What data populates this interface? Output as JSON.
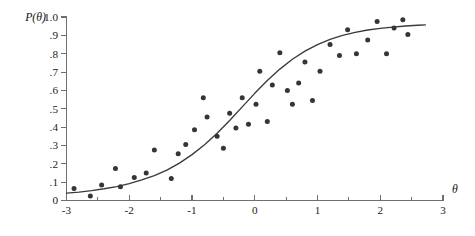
{
  "figure": {
    "background_color": "#ffffff",
    "axis_color": "#6f6f6f",
    "curve_color": "#3a3a3a",
    "point_color": "#353535",
    "y_axis_title": "P(θ)",
    "x_axis_title": "θ"
  },
  "chart_data": {
    "type": "scatter",
    "title": "",
    "subtitle": "",
    "xlabel": "θ",
    "ylabel": "P(θ)",
    "xlim": [
      -3,
      3
    ],
    "ylim": [
      0,
      1.0
    ],
    "grid": false,
    "legend": "none",
    "x_ticks": [
      -3,
      -2,
      -1,
      0,
      1,
      2,
      3
    ],
    "x_tick_labels": [
      "-3",
      "-2",
      "-1",
      "0",
      "1",
      "2",
      "3"
    ],
    "x_minor_ticks": [
      -2.5,
      -1.5,
      -0.5,
      0.5,
      1.5,
      2.5
    ],
    "y_ticks": [
      0,
      0.1,
      0.2,
      0.3,
      0.4,
      0.5,
      0.6,
      0.7,
      0.8,
      0.9,
      1.0
    ],
    "y_tick_labels": [
      "0",
      ".1",
      ".2",
      ".3",
      ".4",
      ".5",
      ".6",
      ".7",
      ".8",
      ".9",
      "1.0"
    ],
    "series": [
      {
        "name": "observed proportions",
        "type": "scatter",
        "marker": "filled-circle",
        "color": "#353535",
        "points": [
          [
            -2.88,
            0.065
          ],
          [
            -2.62,
            0.025
          ],
          [
            -2.44,
            0.085
          ],
          [
            -2.22,
            0.175
          ],
          [
            -2.14,
            0.075
          ],
          [
            -1.92,
            0.125
          ],
          [
            -1.73,
            0.15
          ],
          [
            -1.6,
            0.275
          ],
          [
            -1.33,
            0.12
          ],
          [
            -1.22,
            0.255
          ],
          [
            -1.1,
            0.305
          ],
          [
            -0.96,
            0.385
          ],
          [
            -0.82,
            0.56
          ],
          [
            -0.76,
            0.455
          ],
          [
            -0.6,
            0.35
          ],
          [
            -0.5,
            0.285
          ],
          [
            -0.4,
            0.475
          ],
          [
            -0.3,
            0.395
          ],
          [
            -0.2,
            0.56
          ],
          [
            -0.1,
            0.415
          ],
          [
            0.02,
            0.525
          ],
          [
            0.08,
            0.705
          ],
          [
            0.2,
            0.43
          ],
          [
            0.28,
            0.63
          ],
          [
            0.4,
            0.805
          ],
          [
            0.52,
            0.6
          ],
          [
            0.6,
            0.525
          ],
          [
            0.7,
            0.64
          ],
          [
            0.8,
            0.755
          ],
          [
            0.92,
            0.545
          ],
          [
            1.04,
            0.705
          ],
          [
            1.2,
            0.85
          ],
          [
            1.35,
            0.79
          ],
          [
            1.48,
            0.93
          ],
          [
            1.62,
            0.8
          ],
          [
            1.8,
            0.875
          ],
          [
            1.95,
            0.975
          ],
          [
            2.1,
            0.8
          ],
          [
            2.22,
            0.94
          ],
          [
            2.36,
            0.985
          ],
          [
            2.44,
            0.905
          ]
        ]
      },
      {
        "name": "fitted logistic curve",
        "type": "line",
        "color": "#3a3a3a",
        "x_range": [
          -3.0,
          2.72
        ],
        "model": "logistic",
        "points": [
          [
            -3.0,
            0.04
          ],
          [
            -2.8,
            0.046
          ],
          [
            -2.6,
            0.054
          ],
          [
            -2.4,
            0.064
          ],
          [
            -2.2,
            0.076
          ],
          [
            -2.0,
            0.092
          ],
          [
            -1.8,
            0.112
          ],
          [
            -1.6,
            0.136
          ],
          [
            -1.4,
            0.166
          ],
          [
            -1.2,
            0.204
          ],
          [
            -1.0,
            0.25
          ],
          [
            -0.8,
            0.304
          ],
          [
            -0.6,
            0.366
          ],
          [
            -0.4,
            0.436
          ],
          [
            -0.2,
            0.51
          ],
          [
            0.0,
            0.584
          ],
          [
            0.2,
            0.654
          ],
          [
            0.4,
            0.716
          ],
          [
            0.6,
            0.77
          ],
          [
            0.8,
            0.814
          ],
          [
            1.0,
            0.85
          ],
          [
            1.2,
            0.878
          ],
          [
            1.4,
            0.9
          ],
          [
            1.6,
            0.916
          ],
          [
            1.8,
            0.929
          ],
          [
            2.0,
            0.938
          ],
          [
            2.2,
            0.945
          ],
          [
            2.4,
            0.951
          ],
          [
            2.6,
            0.955
          ],
          [
            2.72,
            0.957
          ]
        ]
      }
    ]
  }
}
